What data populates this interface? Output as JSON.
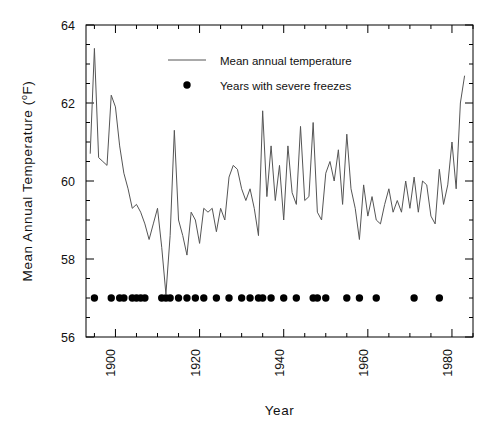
{
  "chart_data": {
    "type": "line",
    "title": "",
    "xlabel": "Year",
    "ylabel": "Mean Annual Temperature (°F)",
    "xlim": [
      1893,
      1985
    ],
    "ylim": [
      56,
      64
    ],
    "xticks": [
      1900,
      1920,
      1940,
      1960,
      1980
    ],
    "xtick_labels": [
      "1900",
      "1920",
      "1940",
      "1960",
      "1980"
    ],
    "xtick_minor_step": 5,
    "yticks": [
      56,
      58,
      60,
      62,
      64
    ],
    "ytick_labels": [
      "56",
      "58",
      "60",
      "62",
      "64"
    ],
    "ytick_minor_step": 0.5,
    "grid": false,
    "legend_position": "upper-center",
    "series": [
      {
        "name": "Mean annual temperature",
        "type": "line",
        "color": "#555555",
        "x": [
          1894,
          1895,
          1896,
          1897,
          1898,
          1899,
          1900,
          1901,
          1902,
          1903,
          1904,
          1905,
          1906,
          1907,
          1908,
          1909,
          1910,
          1911,
          1912,
          1913,
          1914,
          1915,
          1916,
          1917,
          1918,
          1919,
          1920,
          1921,
          1922,
          1923,
          1924,
          1925,
          1926,
          1927,
          1928,
          1929,
          1930,
          1931,
          1932,
          1933,
          1934,
          1935,
          1936,
          1937,
          1938,
          1939,
          1940,
          1941,
          1942,
          1943,
          1944,
          1945,
          1946,
          1947,
          1948,
          1949,
          1950,
          1951,
          1952,
          1953,
          1954,
          1955,
          1956,
          1957,
          1958,
          1959,
          1960,
          1961,
          1962,
          1963,
          1964,
          1965,
          1966,
          1967,
          1968,
          1969,
          1970,
          1971,
          1972,
          1973,
          1974,
          1975,
          1976,
          1977,
          1978,
          1979,
          1980,
          1981,
          1982,
          1983
        ],
        "y": [
          60.7,
          63.4,
          60.6,
          60.5,
          60.4,
          62.2,
          61.9,
          60.9,
          60.2,
          59.8,
          59.3,
          59.4,
          59.2,
          58.9,
          58.5,
          58.9,
          59.3,
          58.3,
          57.1,
          58.6,
          61.3,
          59.0,
          58.6,
          58.1,
          59.2,
          59.0,
          58.4,
          59.3,
          59.2,
          59.3,
          58.7,
          59.3,
          59.0,
          60.1,
          60.4,
          60.3,
          59.8,
          59.5,
          59.8,
          59.3,
          58.6,
          61.8,
          59.6,
          60.9,
          59.5,
          60.4,
          59.0,
          60.9,
          59.7,
          59.4,
          61.4,
          59.5,
          59.6,
          61.5,
          59.2,
          59.0,
          60.2,
          60.5,
          60.0,
          60.8,
          59.4,
          61.2,
          59.8,
          59.3,
          58.5,
          59.9,
          59.1,
          59.6,
          59.0,
          58.9,
          59.4,
          59.8,
          59.2,
          59.5,
          59.2,
          60.0,
          59.3,
          60.1,
          59.2,
          60.0,
          59.9,
          59.1,
          58.9,
          60.3,
          59.4,
          59.9,
          61.0,
          59.8,
          62.0,
          62.7
        ]
      },
      {
        "name": "Years with severe freezes",
        "type": "scatter",
        "color": "#000000",
        "y_value": 57.0,
        "x": [
          1895,
          1899,
          1901,
          1902,
          1904,
          1905,
          1906,
          1907,
          1911,
          1912,
          1913,
          1915,
          1917,
          1919,
          1921,
          1924,
          1927,
          1930,
          1932,
          1934,
          1935,
          1937,
          1940,
          1943,
          1947,
          1948,
          1950,
          1955,
          1958,
          1962,
          1971,
          1977
        ]
      }
    ]
  },
  "legend": {
    "items": [
      {
        "label": "Mean annual temperature",
        "marker": "line"
      },
      {
        "label": "Years with severe freezes",
        "marker": "dot"
      }
    ]
  }
}
